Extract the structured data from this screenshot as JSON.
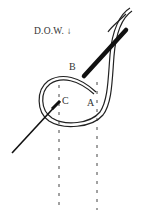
{
  "diagram": {
    "direction_label": "D.O.W. ↓",
    "points": [
      {
        "id": "A",
        "label": "A"
      },
      {
        "id": "B",
        "label": "B"
      },
      {
        "id": "C",
        "label": "C"
      }
    ],
    "colors": {
      "ink": "#222222",
      "background": "#ffffff"
    }
  }
}
